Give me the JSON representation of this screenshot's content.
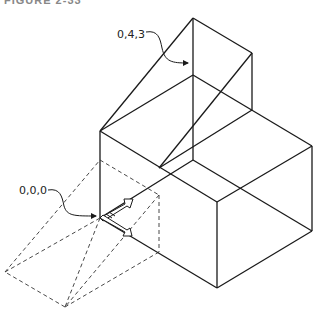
{
  "figure": {
    "caption": "FIGURE 2-33",
    "caption_right": ""
  },
  "labels": {
    "point_top": "0,4,3",
    "point_origin": "0,0,0"
  },
  "colors": {
    "line": "#1a1a1a",
    "dashed": "#333333"
  }
}
